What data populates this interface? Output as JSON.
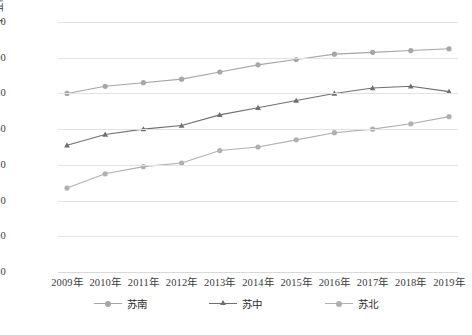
{
  "chart_data": {
    "type": "line",
    "title": "",
    "xlabel": "",
    "ylabel": "产业结构高级化水平",
    "categories": [
      "2009年",
      "2010年",
      "2011年",
      "2012年",
      "2013年",
      "2014年",
      "2015年",
      "2016年",
      "2017年",
      "2018年",
      "2019年"
    ],
    "ylim": [
      5.8,
      7.2
    ],
    "ytick_values": [
      5.8,
      6.0,
      6.2,
      6.4,
      6.6,
      6.8,
      7.0,
      7.2
    ],
    "ytick_labels": [
      "5.80",
      "6.00",
      "6.20",
      "6.40",
      "6.60",
      "6.80",
      "7.00",
      "7.20"
    ],
    "grid": true,
    "legend_position": "bottom",
    "series": [
      {
        "name": "苏南",
        "color": "#a6a6a6",
        "marker": "circle",
        "values": [
          6.8,
          6.84,
          6.86,
          6.88,
          6.92,
          6.96,
          6.99,
          7.02,
          7.03,
          7.04,
          7.05
        ]
      },
      {
        "name": "苏中",
        "color": "#6f6f6f",
        "marker": "triangle",
        "values": [
          6.51,
          6.57,
          6.6,
          6.62,
          6.68,
          6.72,
          6.76,
          6.8,
          6.83,
          6.84,
          6.81
        ]
      },
      {
        "name": "苏北",
        "color": "#b0b0b0",
        "marker": "circle",
        "values": [
          6.27,
          6.35,
          6.39,
          6.41,
          6.48,
          6.5,
          6.54,
          6.58,
          6.6,
          6.63,
          6.67
        ]
      }
    ]
  }
}
